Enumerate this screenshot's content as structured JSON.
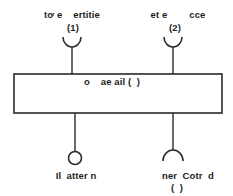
{
  "diagram": {
    "type": "component-interface-diagram",
    "component": {
      "label": "o    ae ail (  )"
    },
    "interfaces": [
      {
        "id": "top-left",
        "kind": "required",
        "label_line1": "tơ e    ertitie",
        "label_line2": "(1)"
      },
      {
        "id": "top-right",
        "kind": "required",
        "label_line1": "et e        cce",
        "label_line2": "(2)"
      },
      {
        "id": "bottom-left",
        "kind": "provided",
        "label_line1": "Il  atter n"
      },
      {
        "id": "bottom-right",
        "kind": "required",
        "label_line1": "ner  Cotr  d",
        "label_line2": "(  )"
      }
    ],
    "colors": {
      "stroke": "#2a2a2a",
      "text": "#1e1e1e",
      "background": "#ffffff"
    }
  }
}
